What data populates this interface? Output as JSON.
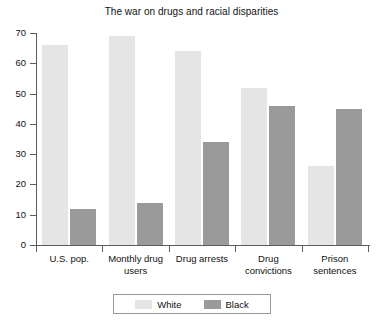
{
  "chart_data": {
    "type": "bar",
    "title": "The war on drugs and racial disparities",
    "xlabel": "",
    "ylabel": "",
    "ylim": [
      0,
      70
    ],
    "yticks": [
      0,
      10,
      20,
      30,
      40,
      50,
      60,
      70
    ],
    "grid": false,
    "legend_position": "bottom",
    "categories": [
      "U.S. pop.",
      "Monthly drug users",
      "Drug arrests",
      "Drug convictions",
      "Prison sentences"
    ],
    "series": [
      {
        "name": "White",
        "color": "#e5e5e5",
        "values": [
          66,
          69,
          64,
          52,
          26
        ]
      },
      {
        "name": "Black",
        "color": "#9a9a9a",
        "values": [
          12,
          14,
          34,
          46,
          45
        ]
      }
    ]
  }
}
